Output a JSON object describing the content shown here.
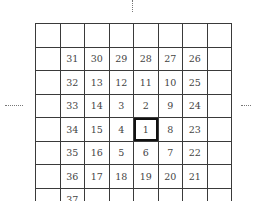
{
  "figure": {
    "ellipsis_top": "⋮",
    "ellipsis_left": "……",
    "ellipsis_right": "……",
    "highlighted_cell": "1",
    "rows": [
      [
        "",
        "",
        "",
        "",
        "",
        "",
        "",
        ""
      ],
      [
        "",
        "31",
        "30",
        "29",
        "28",
        "27",
        "26",
        ""
      ],
      [
        "",
        "32",
        "13",
        "12",
        "11",
        "10",
        "25",
        ""
      ],
      [
        "",
        "33",
        "14",
        "3",
        "2",
        "9",
        "24",
        ""
      ],
      [
        "",
        "34",
        "15",
        "4",
        "1",
        "8",
        "23",
        ""
      ],
      [
        "",
        "35",
        "16",
        "5",
        "6",
        "7",
        "22",
        ""
      ],
      [
        "",
        "36",
        "17",
        "18",
        "19",
        "20",
        "21",
        ""
      ],
      [
        "",
        "37",
        "",
        "",
        "",
        "",
        "",
        ""
      ]
    ]
  }
}
